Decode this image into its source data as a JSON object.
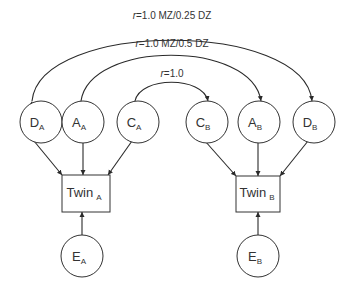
{
  "diagram": {
    "type": "twin-ACDE-model",
    "correlations": {
      "D": {
        "label_italic": "r",
        "label_rest": "=1.0 MZ/0.25 DZ"
      },
      "A": {
        "label_italic": "r",
        "label_rest": "=1.0 MZ/0.5 DZ"
      },
      "C": {
        "label_italic": "r",
        "label_rest": "=1.0"
      }
    },
    "nodes": {
      "D_A": {
        "main": "D",
        "sub": "A"
      },
      "A_A": {
        "main": "A",
        "sub": "A"
      },
      "C_A": {
        "main": "C",
        "sub": "A"
      },
      "C_B": {
        "main": "C",
        "sub": "B"
      },
      "A_B": {
        "main": "A",
        "sub": "B"
      },
      "D_B": {
        "main": "D",
        "sub": "B"
      },
      "E_A": {
        "main": "E",
        "sub": "A"
      },
      "E_B": {
        "main": "E",
        "sub": "B"
      },
      "Twin_A": {
        "main": "Twin",
        "sub": "A"
      },
      "Twin_B": {
        "main": "Twin",
        "sub": "B"
      }
    },
    "colors": {
      "stroke": "#333333",
      "text": "#333333",
      "background": "#ffffff"
    }
  }
}
